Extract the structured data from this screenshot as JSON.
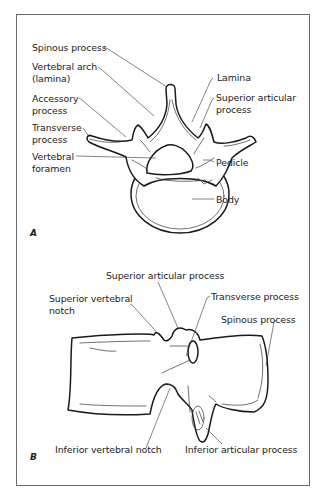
{
  "figure": {
    "panels": [
      {
        "id": "A",
        "letter": "A",
        "view": "superior view of lumbar vertebra",
        "labels": {
          "spinous_process": "Spinous process",
          "vertebral_arch_1": "Vertebral arch",
          "vertebral_arch_2": "(lamina)",
          "accessory_process_1": "Accessory",
          "accessory_process_2": "process",
          "transverse_process_1": "Transverse",
          "transverse_process_2": "process",
          "vertebral_foramen_1": "Vertebral",
          "vertebral_foramen_2": "foramen",
          "lamina": "Lamina",
          "superior_articular_process_1": "Superior articular",
          "superior_articular_process_2": "process",
          "pedicle": "Pedicle",
          "body": "Body"
        }
      },
      {
        "id": "B",
        "letter": "B",
        "view": "lateral view of lumbar vertebra",
        "labels": {
          "superior_articular_process": "Superior articular process",
          "superior_vertebral_notch_1": "Superior vertebral",
          "superior_vertebral_notch_2": "notch",
          "transverse_process": "Transverse process",
          "spinous_process": "Spinous process",
          "inferior_vertebral_notch": "Inferior vertebral notch",
          "inferior_articular_process": "Inferior articular process"
        }
      }
    ]
  }
}
